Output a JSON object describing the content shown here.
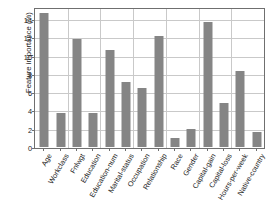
{
  "chart_data": {
    "type": "bar",
    "title": "",
    "xlabel": "",
    "ylabel": "Feature importance (%)",
    "ylim": [
      0,
      15.2
    ],
    "yticks": [
      0,
      2,
      4,
      6,
      8,
      10,
      12,
      14
    ],
    "ytick_labels": [
      "0",
      "2",
      "4",
      "6",
      "8",
      "10",
      "12",
      "14"
    ],
    "grid": true,
    "legend": "none",
    "bar_color": "#858585",
    "categories": [
      "Age",
      "Workclass",
      "Fnlwgt",
      "Education",
      "Education-num",
      "Marital-status",
      "Occupation",
      "Relationship",
      "Race",
      "Gender",
      "Capital-gain",
      "Capital-loss",
      "Hours-per-week",
      "Native-country"
    ],
    "values": [
      14.7,
      3.7,
      11.8,
      3.75,
      10.65,
      7.15,
      6.45,
      12.1,
      1.0,
      2.0,
      13.7,
      4.8,
      8.35,
      1.65
    ]
  },
  "figure": {
    "background": "#ffffff",
    "frame_color": "#6f6f6f",
    "gridline_color": "#c9c9c9",
    "text_color": "#1c1c1c"
  }
}
